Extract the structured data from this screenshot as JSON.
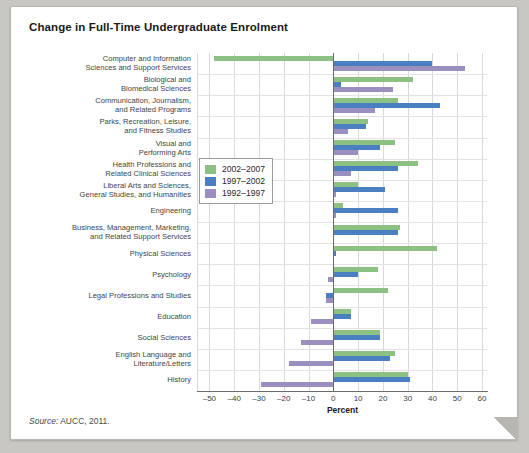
{
  "chart_title": "Change in Full-Time Undergraduate Enrolment",
  "source_note": {
    "prefix": "Source:",
    "text": "AUCC, 2011."
  },
  "legend": {
    "items": [
      {
        "label": "2002–2007",
        "color": "#8cc183"
      },
      {
        "label": "1997–2002",
        "color": "#4a7fc1"
      },
      {
        "label": "1992–1997",
        "color": "#9b8fc0"
      }
    ]
  },
  "chart_data": {
    "type": "bar",
    "orientation": "horizontal",
    "title": "Change in Full-Time Undergraduate Enrolment",
    "xlabel": "Percent",
    "ylabel": "",
    "xlim": [
      -55,
      62
    ],
    "xticks": [
      -50,
      -40,
      -30,
      -20,
      -10,
      0,
      10,
      20,
      30,
      40,
      50,
      60
    ],
    "xticklabels": [
      "–50",
      "–40",
      "–30",
      "–20",
      "–10",
      "0",
      "10",
      "20",
      "30",
      "40",
      "50",
      "60"
    ],
    "grid": true,
    "legend_position": "center-left-inside",
    "categories": [
      "Computer and Information\nSciences and Support Services",
      "Biological and\nBiomedical Sciences",
      "Communication, Journalism,\nand Related Programs",
      "Parks, Recreation, Leisure,\nand Fitness Studies",
      "Visual and\nPerforming Arts",
      "Health Professions and\nRelated Clinical Sciences",
      "Liberal Arts and Sciences,\nGeneral Studies, and Humanities",
      "Engineering",
      "Business, Management, Marketing,\nand Related Support Services",
      "Physical Sciences",
      "Psychology",
      "Legal Professions and Studies",
      "Education",
      "Social Sciences",
      "English Language and\nLiterature/Letters",
      "History"
    ],
    "series": [
      {
        "name": "2002–2007",
        "color": "#8cc183",
        "values": [
          -48,
          32,
          26,
          14,
          25,
          34,
          10,
          4,
          27,
          42,
          18,
          22,
          7,
          19,
          25,
          30
        ]
      },
      {
        "name": "1997–2002",
        "color": "#4a7fc1",
        "values": [
          40,
          3,
          43,
          13,
          19,
          26,
          21,
          26,
          26,
          1,
          10,
          -3,
          7,
          19,
          23,
          31
        ]
      },
      {
        "name": "1992–1997",
        "color": "#9b8fc0",
        "values": [
          53,
          24,
          17,
          6,
          10,
          7,
          1,
          1,
          0,
          0,
          -2,
          -3,
          -9,
          -13,
          -18,
          -29
        ]
      }
    ]
  }
}
